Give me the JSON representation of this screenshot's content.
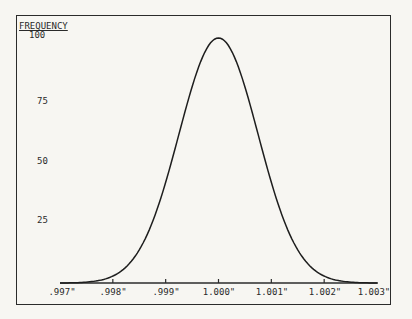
{
  "chart_data": {
    "type": "line",
    "title": "",
    "xlabel": "",
    "ylabel": "FREQUENCY",
    "ylabel_underline": true,
    "y_ticks": [
      "100",
      "75",
      "50",
      "25"
    ],
    "y_tick_values": [
      100,
      75,
      50,
      25
    ],
    "ylim": [
      0,
      100
    ],
    "x_ticks": [
      ".997\"",
      ".998\"",
      ".999\"",
      "1.000\"",
      "1.001\"",
      "1.002\"",
      "1.003\""
    ],
    "x_tick_values": [
      0.997,
      0.998,
      0.999,
      1.0,
      1.001,
      1.002,
      1.003
    ],
    "xlim": [
      0.997,
      1.003
    ],
    "grid": false,
    "legend": null,
    "series": [
      {
        "name": "normal distribution",
        "description": "Bell-shaped (normal) frequency curve centered at 1.000\" with peak frequency 100, tapering to 0 at .997\" and 1.003\"",
        "x": [
          0.997,
          0.9975,
          0.998,
          0.9985,
          0.999,
          0.9995,
          1.0,
          1.0005,
          1.001,
          1.0015,
          1.002,
          1.0025,
          1.003
        ],
        "values": [
          0,
          4,
          13,
          32,
          60,
          88,
          100,
          88,
          60,
          32,
          13,
          4,
          0
        ]
      }
    ],
    "colors": {
      "line": "#1e1e1e",
      "frame": "#2b2b2b",
      "background": "#f7f6f2"
    }
  }
}
